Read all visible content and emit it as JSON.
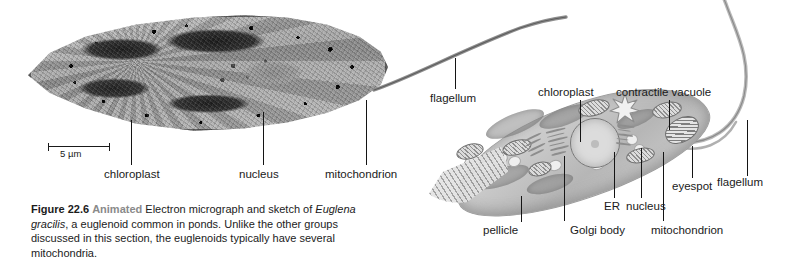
{
  "figure": {
    "number": "Figure 22.6",
    "animated_badge": "Animated",
    "caption_part1": " Electron micrograph and sketch of ",
    "species_italic": "Euglena gracilis",
    "caption_part2": ", a euglenoid common in ponds. Unlike the other groups discussed in this section, the euglenoids typically have several mitochondria."
  },
  "micrograph": {
    "scale_bar_label": "5 µm",
    "labels": [
      {
        "name": "chloroplast",
        "text": "chloroplast"
      },
      {
        "name": "nucleus",
        "text": "nucleus"
      },
      {
        "name": "mitochondrion",
        "text": "mitochondrion"
      },
      {
        "name": "flagellum",
        "text": "flagellum"
      }
    ]
  },
  "sketch": {
    "labels": [
      {
        "name": "chloroplast",
        "text": "chloroplast"
      },
      {
        "name": "contractile-vacuole",
        "text": "contractile vacuole"
      },
      {
        "name": "flagellum",
        "text": "flagellum"
      },
      {
        "name": "eyespot",
        "text": "eyespot"
      },
      {
        "name": "nucleus",
        "text": "nucleus"
      },
      {
        "name": "er",
        "text": "ER"
      },
      {
        "name": "golgi-body",
        "text": "Golgi body"
      },
      {
        "name": "mitochondrion",
        "text": "mitochondrion"
      },
      {
        "name": "pellicle",
        "text": "pellicle"
      }
    ]
  },
  "colors": {
    "text": "#1b1b1b",
    "animated_badge": "#8a8a8a",
    "leader_line": "#141414",
    "background": "#ffffff"
  }
}
